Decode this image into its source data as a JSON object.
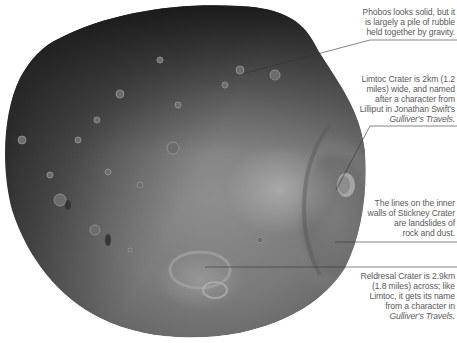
{
  "image": {
    "subject": "Phobos (moon of Mars), grayscale photograph",
    "background_color": "#ffffff"
  },
  "callouts": [
    {
      "id": "rubble",
      "lines": [
        "Phobos looks solid, but it",
        "is largely a pile of rubble",
        "held together by gravity."
      ],
      "italic_line": null
    },
    {
      "id": "limtoc",
      "lines": [
        "Limtoc Crater is 2km (1.2",
        "miles) wide, and named",
        "after a character from",
        "Lilliput in Jonathan Swift's"
      ],
      "italic_line": "Gulliver's Travels."
    },
    {
      "id": "stickney",
      "lines": [
        "The lines on the inner",
        "walls of Stickney Crater",
        "are landslides of",
        "rock and dust."
      ],
      "italic_line": null
    },
    {
      "id": "reldresal",
      "lines": [
        "Reldresal Crater is 2.9km",
        "(1.8 miles) across; like",
        "Limtoc, it gets its name",
        "from a character in"
      ],
      "italic_line": "Gulliver's Travels."
    }
  ]
}
